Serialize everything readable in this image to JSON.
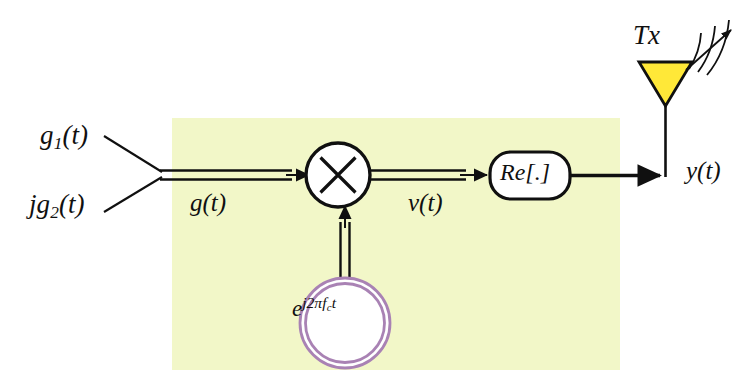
{
  "diagram": {
    "panel": {
      "name": "baseband-rf-processing-panel",
      "fill": "#F2F7C8",
      "x": 172,
      "y": 118,
      "width": 448,
      "height": 252
    },
    "inputs": [
      {
        "id": "g1",
        "label_html": "g<sub>1</sub>(t)",
        "label": "g1(t)",
        "description": "in-phase baseband component"
      },
      {
        "id": "jg2",
        "label_html": "jg<sub>2</sub>(t)",
        "label": "jg2(t)",
        "description": "quadrature baseband component"
      }
    ],
    "signals": [
      {
        "id": "g",
        "label": "g(t)",
        "type": "complex",
        "line_style": "double"
      },
      {
        "id": "v",
        "label": "v(t)",
        "type": "complex",
        "line_style": "double"
      },
      {
        "id": "y",
        "label": "y(t)",
        "type": "real",
        "line_style": "single"
      }
    ],
    "blocks": [
      {
        "id": "multiplier",
        "name": "multiplier-block",
        "symbol": "×",
        "shape": "circle",
        "fill": "#ffffff",
        "stroke": "#101010",
        "cx": 338,
        "cy": 175,
        "r": 32
      },
      {
        "id": "oscillator",
        "name": "carrier-oscillator-block",
        "label": "e^{j2πf_c t}",
        "label_parts": {
          "base": "e",
          "exponent": "j2πf",
          "sub": "c",
          "tail": "t"
        },
        "shape": "double-circle",
        "fill": "#ffffff",
        "stroke": "#A982B4",
        "cx": 345,
        "cy": 323,
        "r": 45
      },
      {
        "id": "real-part",
        "name": "real-part-block",
        "label": "Re[.]",
        "shape": "rounded-rect",
        "fill": "#ffffff",
        "stroke": "#101010",
        "x": 490,
        "y": 152,
        "width": 80,
        "height": 47
      }
    ],
    "antenna": {
      "name": "transmit-antenna",
      "label": "Tx",
      "triangle_fill": "#FFE838",
      "triangle_stroke": "#101010",
      "apex_x": 665,
      "apex_y": 106,
      "top_y": 62,
      "half_width": 26,
      "radiation_arcs": 3,
      "arrow": "up-right"
    },
    "colors": {
      "panel": "#F2F7C8",
      "line": "#101010",
      "oscillator_ring": "#A982B4",
      "antenna": "#FFE838",
      "background": "#ffffff"
    }
  }
}
